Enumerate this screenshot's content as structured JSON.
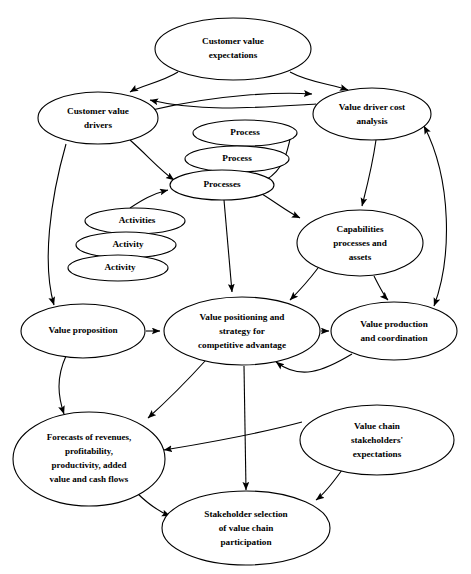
{
  "diagram": {
    "type": "flow-diagram",
    "title_visible": false,
    "background_color": "#ffffff",
    "line_color": "#000000",
    "nodes": [
      {
        "id": "customer-value-expectations",
        "lines": [
          "Customer value",
          "expectations"
        ],
        "cx": 233,
        "cy": 49,
        "rx": 78,
        "ry": 31
      },
      {
        "id": "customer-value-drivers",
        "lines": [
          "Customer value",
          "drivers"
        ],
        "cx": 98,
        "cy": 118,
        "rx": 60,
        "ry": 26
      },
      {
        "id": "value-driver-cost-analysis",
        "lines": [
          "Value driver cost",
          "analysis"
        ],
        "cx": 372,
        "cy": 114,
        "rx": 59,
        "ry": 26
      },
      {
        "id": "process-top",
        "lines": [
          "Process"
        ],
        "cx": 245,
        "cy": 133,
        "rx": 52,
        "ry": 13
      },
      {
        "id": "process-middle",
        "lines": [
          "Process"
        ],
        "cx": 237,
        "cy": 159,
        "rx": 52,
        "ry": 13
      },
      {
        "id": "processes-bottom",
        "lines": [
          "Processes"
        ],
        "cx": 222,
        "cy": 185,
        "rx": 52,
        "ry": 15
      },
      {
        "id": "activities-top",
        "lines": [
          "Activities"
        ],
        "cx": 135,
        "cy": 221,
        "rx": 50,
        "ry": 13
      },
      {
        "id": "activity-middle",
        "lines": [
          "Activity"
        ],
        "cx": 126,
        "cy": 245,
        "rx": 50,
        "ry": 13
      },
      {
        "id": "activity-bottom",
        "lines": [
          "Activity"
        ],
        "cx": 118,
        "cy": 268,
        "rx": 50,
        "ry": 13
      },
      {
        "id": "capabilities-processes-assets",
        "lines": [
          "Capabilities",
          "processes and",
          "assets"
        ],
        "cx": 360,
        "cy": 243,
        "rx": 63,
        "ry": 33
      },
      {
        "id": "value-proposition",
        "lines": [
          "Value proposition"
        ],
        "cx": 83,
        "cy": 331,
        "rx": 62,
        "ry": 27
      },
      {
        "id": "value-positioning-strategy",
        "lines": [
          "Value positioning and",
          "strategy for",
          "competitive advantage"
        ],
        "cx": 242,
        "cy": 331,
        "rx": 78,
        "ry": 34
      },
      {
        "id": "value-production-coordination",
        "lines": [
          "Value production",
          "and coordination"
        ],
        "cx": 394,
        "cy": 331,
        "rx": 63,
        "ry": 29
      },
      {
        "id": "forecasts",
        "lines": [
          "Forecasts of revenues,",
          "profitability,",
          "productivity, added",
          "value and cash flows"
        ],
        "cx": 89,
        "cy": 459,
        "rx": 76,
        "ry": 47
      },
      {
        "id": "value-chain-stakeholders-expectations",
        "lines": [
          "Value chain",
          "stakeholders'",
          "expectations"
        ],
        "cx": 377,
        "cy": 440,
        "rx": 77,
        "ry": 35
      },
      {
        "id": "stakeholder-selection",
        "lines": [
          "Stakeholder selection",
          "of value chain",
          "participation"
        ],
        "cx": 246,
        "cy": 528,
        "rx": 84,
        "ry": 37
      }
    ],
    "edges": [
      {
        "id": "cve-to-cvd",
        "from": "customer-value-expectations",
        "to": "customer-value-drivers",
        "arrow": "end"
      },
      {
        "id": "cve-to-vdca",
        "from": "customer-value-expectations",
        "to": "value-driver-cost-analysis",
        "arrow": "end"
      },
      {
        "id": "cvd-to-vdca",
        "from": "customer-value-drivers",
        "to": "value-driver-cost-analysis",
        "arrow": "end"
      },
      {
        "id": "vdca-to-cvd",
        "from": "value-driver-cost-analysis",
        "to": "customer-value-drivers",
        "arrow": "end"
      },
      {
        "id": "cvd-to-processes",
        "from": "customer-value-drivers",
        "to": "processes-bottom",
        "arrow": "end"
      },
      {
        "id": "cvd-to-value-proposition",
        "from": "customer-value-drivers",
        "to": "value-proposition",
        "arrow": "end"
      },
      {
        "id": "activities-to-processes",
        "from": "activities-top",
        "to": "processes-bottom",
        "arrow": "end"
      },
      {
        "id": "processes-to-vdca",
        "from": "processes-bottom",
        "to": "value-driver-cost-analysis",
        "arrow": "end"
      },
      {
        "id": "processes-to-capabilities",
        "from": "processes-bottom",
        "to": "capabilities-processes-assets",
        "arrow": "end"
      },
      {
        "id": "processes-to-value-positioning",
        "from": "processes-bottom",
        "to": "value-positioning-strategy",
        "arrow": "end"
      },
      {
        "id": "vdca-to-capabilities",
        "from": "value-driver-cost-analysis",
        "to": "capabilities-processes-assets",
        "arrow": "end"
      },
      {
        "id": "vdca-to-vpc",
        "from": "value-driver-cost-analysis",
        "to": "value-production-coordination",
        "arrow": "both"
      },
      {
        "id": "capabilities-to-value-positioning",
        "from": "capabilities-processes-assets",
        "to": "value-positioning-strategy",
        "arrow": "end"
      },
      {
        "id": "capabilities-to-vpc",
        "from": "capabilities-processes-assets",
        "to": "value-production-coordination",
        "arrow": "end"
      },
      {
        "id": "value-proposition-to-value-positioning",
        "from": "value-proposition",
        "to": "value-positioning-strategy",
        "arrow": "end"
      },
      {
        "id": "value-positioning-to-vpc",
        "from": "value-positioning-strategy",
        "to": "value-production-coordination",
        "arrow": "end"
      },
      {
        "id": "value-proposition-to-forecasts",
        "from": "value-proposition",
        "to": "forecasts",
        "arrow": "end"
      },
      {
        "id": "value-positioning-to-forecasts",
        "from": "value-positioning-strategy",
        "to": "forecasts",
        "arrow": "end"
      },
      {
        "id": "vpc-to-value-positioning",
        "from": "value-production-coordination",
        "to": "value-positioning-strategy",
        "arrow": "end"
      },
      {
        "id": "vcse-to-forecasts",
        "from": "value-chain-stakeholders-expectations",
        "to": "forecasts",
        "arrow": "end"
      },
      {
        "id": "vcse-to-stakeholder-selection",
        "from": "value-chain-stakeholders-expectations",
        "to": "stakeholder-selection",
        "arrow": "end"
      },
      {
        "id": "forecasts-to-stakeholder-selection",
        "from": "forecasts",
        "to": "stakeholder-selection",
        "arrow": "end"
      },
      {
        "id": "value-positioning-to-stakeholder-selection",
        "from": "value-positioning-strategy",
        "to": "stakeholder-selection",
        "arrow": "end"
      }
    ]
  }
}
